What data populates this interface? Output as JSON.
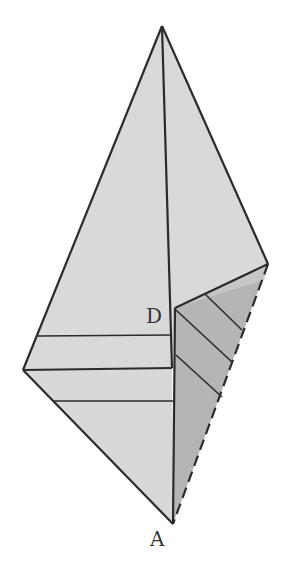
{
  "diagram": {
    "labels": {
      "D": "D",
      "A": "A"
    },
    "colors": {
      "background": "#ffffff",
      "light_face": "#d9d9d9",
      "dark_face": "#b3b3b3",
      "stroke": "#2b2b2b"
    },
    "points": {
      "apex": [
        162,
        26
      ],
      "right": [
        268,
        264
      ],
      "left": [
        23,
        370
      ],
      "A": [
        173,
        524
      ],
      "D": [
        175,
        308
      ],
      "fold_corner": [
        172,
        368
      ]
    }
  }
}
